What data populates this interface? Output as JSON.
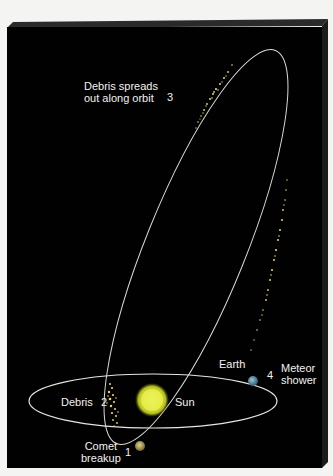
{
  "diagram": {
    "colors": {
      "background": "#010101",
      "panel_edge": "#2b2b2b",
      "orbit_line": "#d9d9d0",
      "debris": "#e8d95a",
      "sun": "#e4ea3c",
      "earth": "#5a8fa6",
      "comet": "#a59a5e",
      "text": "#f2f2f2"
    },
    "labels": {
      "debris_spreads_line1": "Debris spreads",
      "debris_spreads_line2": "out along orbit",
      "step3": "3",
      "earth": "Earth",
      "step4": "4",
      "meteor_line1": "Meteor",
      "meteor_line2": "shower",
      "debris": "Debris",
      "step2": "2",
      "sun": "Sun",
      "comet_line1": "Comet",
      "comet_line2": "breakup",
      "step1": "1"
    },
    "steps": [
      {
        "number": "1",
        "label": "Comet breakup"
      },
      {
        "number": "2",
        "label": "Debris"
      },
      {
        "number": "3",
        "label": "Debris spreads out along orbit"
      },
      {
        "number": "4",
        "label": "Meteor shower"
      }
    ],
    "bodies": [
      "Sun",
      "Earth"
    ]
  }
}
